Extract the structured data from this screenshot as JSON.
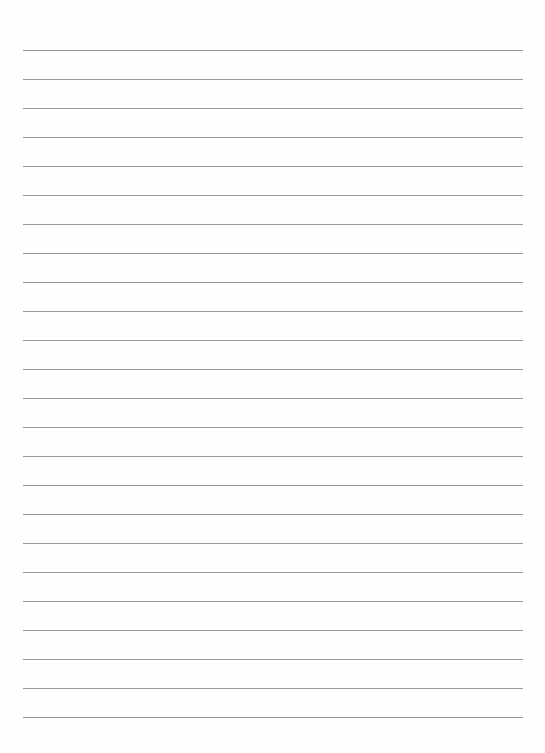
{
  "page": {
    "type": "lined-paper",
    "background": "#fefefe",
    "line_color": "#9a9a9a",
    "line_count": 24,
    "first_line_y": 50,
    "line_spacing": 29,
    "line_left": 23,
    "line_width": 500,
    "lines": [
      "",
      "",
      "",
      "",
      "",
      "",
      "",
      "",
      "",
      "",
      "",
      "",
      "",
      "",
      "",
      "",
      "",
      "",
      "",
      "",
      "",
      "",
      "",
      ""
    ]
  }
}
